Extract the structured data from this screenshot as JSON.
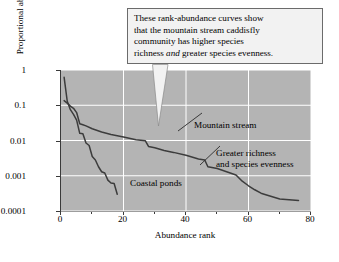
{
  "chart_data": {
    "type": "line",
    "title": "",
    "xlabel": "Abundance rank",
    "ylabel": "Proportional abundance",
    "xlim": [
      0,
      80
    ],
    "ylim": [
      0.0001,
      1
    ],
    "yscale": "log",
    "grid": true,
    "grid_color": "#ffffff",
    "plot_background": "#b4b4b4",
    "line_color": "#3c3c3c",
    "legend": "none",
    "xticks": [
      0,
      20,
      40,
      60,
      80
    ],
    "xtick_labels": [
      "0",
      "20",
      "40",
      "60",
      "80"
    ],
    "xticks_minor": [
      10,
      30,
      50,
      70
    ],
    "yticks": [
      1,
      0.1,
      0.01,
      0.001,
      0.0001
    ],
    "ytick_labels": [
      "1",
      "0.1",
      "0.01",
      "0.001",
      "0.0001"
    ],
    "series": [
      {
        "name": "Coastal ponds",
        "x": [
          1,
          2,
          3,
          4,
          5,
          6,
          7,
          8,
          9,
          10,
          11,
          12,
          13,
          14,
          15,
          16,
          17,
          18
        ],
        "values": [
          0.62,
          0.13,
          0.075,
          0.055,
          0.038,
          0.016,
          0.0155,
          0.0085,
          0.0072,
          0.0035,
          0.0028,
          0.0018,
          0.0013,
          0.0012,
          0.00075,
          0.00062,
          0.0006,
          0.0003
        ]
      },
      {
        "name": "Mountain stream",
        "x": [
          1,
          2,
          3,
          4,
          5,
          6,
          7,
          8,
          10,
          13,
          16,
          20,
          24,
          27,
          28,
          30,
          33,
          36,
          40,
          44,
          46,
          47,
          50,
          53,
          56,
          58,
          60,
          62,
          64,
          65,
          70,
          76
        ],
        "values": [
          0.135,
          0.115,
          0.095,
          0.082,
          0.062,
          0.03,
          0.028,
          0.026,
          0.0215,
          0.0175,
          0.0148,
          0.0125,
          0.0105,
          0.0098,
          0.0068,
          0.0062,
          0.0052,
          0.0046,
          0.0038,
          0.003,
          0.0028,
          0.0018,
          0.0016,
          0.0013,
          0.00105,
          0.0007,
          0.00052,
          0.0004,
          0.00032,
          0.0003,
          0.00022,
          0.0002
        ]
      }
    ],
    "annotations": [
      {
        "name": "mountain-stream",
        "text": "Mountain stream"
      },
      {
        "name": "coastal-ponds",
        "text": "Coastal ponds"
      },
      {
        "name": "greater-richness-line1",
        "text": "Greater richness"
      },
      {
        "name": "greater-richness-line2",
        "text": "and species evenness"
      }
    ]
  },
  "callout": {
    "line1": "These rank-abundance curves show",
    "line2": "that the mountain stream caddisfly",
    "line3": "community has higher species",
    "line4_a": "richness ",
    "line4_italic": "and",
    "line4_b": " greater species evenness."
  }
}
